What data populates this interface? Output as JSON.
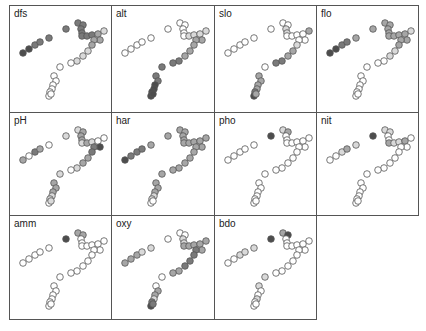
{
  "chart_data": {
    "type": "scatter",
    "title": "",
    "layout": {
      "columns": 4,
      "rows": 3,
      "panel_width": 103,
      "panel_height": 104
    },
    "shade_palette": [
      "#ffffff",
      "#d9d9d9",
      "#a6a6a6",
      "#7a7a7a",
      "#4d4d4d"
    ],
    "points": [
      {
        "x": 13,
        "y": 45
      },
      {
        "x": 19,
        "y": 41
      },
      {
        "x": 25,
        "y": 37
      },
      {
        "x": 30,
        "y": 34
      },
      {
        "x": 39,
        "y": 30
      },
      {
        "x": 56,
        "y": 21
      },
      {
        "x": 68,
        "y": 15
      },
      {
        "x": 73,
        "y": 17
      },
      {
        "x": 71,
        "y": 21
      },
      {
        "x": 72,
        "y": 25
      },
      {
        "x": 72,
        "y": 28
      },
      {
        "x": 77,
        "y": 28
      },
      {
        "x": 82,
        "y": 27
      },
      {
        "x": 88,
        "y": 26
      },
      {
        "x": 94,
        "y": 23
      },
      {
        "x": 90,
        "y": 32
      },
      {
        "x": 84,
        "y": 32
      },
      {
        "x": 82,
        "y": 37
      },
      {
        "x": 78,
        "y": 43
      },
      {
        "x": 73,
        "y": 48
      },
      {
        "x": 67,
        "y": 53
      },
      {
        "x": 61,
        "y": 55
      },
      {
        "x": 50,
        "y": 59
      },
      {
        "x": 44,
        "y": 68
      },
      {
        "x": 46,
        "y": 73
      },
      {
        "x": 43,
        "y": 77
      },
      {
        "x": 42,
        "y": 81
      },
      {
        "x": 40,
        "y": 84
      },
      {
        "x": 39,
        "y": 88
      },
      {
        "x": 41,
        "y": 86
      }
    ],
    "panels": [
      {
        "label": "dfs",
        "shades": [
          4,
          4,
          3,
          3,
          3,
          3,
          3,
          3,
          3,
          3,
          3,
          3,
          3,
          2,
          1,
          2,
          2,
          2,
          1,
          1,
          1,
          0,
          0,
          0,
          0,
          0,
          0,
          0,
          0,
          0
        ]
      },
      {
        "label": "alt",
        "shades": [
          0,
          0,
          0,
          0,
          0,
          0,
          0,
          0,
          0,
          0,
          0,
          1,
          1,
          1,
          1,
          2,
          2,
          2,
          2,
          2,
          3,
          3,
          3,
          3,
          3,
          4,
          4,
          4,
          4,
          4
        ]
      },
      {
        "label": "slo",
        "shades": [
          0,
          0,
          0,
          0,
          0,
          0,
          0,
          0,
          1,
          1,
          0,
          0,
          0,
          0,
          2,
          0,
          0,
          1,
          2,
          2,
          3,
          3,
          0,
          2,
          2,
          2,
          2,
          3,
          4,
          2
        ]
      },
      {
        "label": "flo",
        "shades": [
          4,
          4,
          3,
          3,
          2,
          2,
          2,
          2,
          2,
          2,
          2,
          2,
          2,
          2,
          1,
          2,
          2,
          2,
          1,
          1,
          0,
          0,
          0,
          0,
          0,
          0,
          0,
          0,
          0,
          0
        ]
      },
      {
        "label": "pH",
        "shades": [
          2,
          0,
          3,
          2,
          0,
          1,
          1,
          2,
          2,
          2,
          1,
          2,
          1,
          0,
          0,
          4,
          3,
          3,
          2,
          2,
          1,
          0,
          1,
          2,
          2,
          2,
          1,
          1,
          0,
          1
        ]
      },
      {
        "label": "har",
        "shades": [
          4,
          3,
          3,
          3,
          2,
          2,
          2,
          2,
          2,
          2,
          2,
          2,
          2,
          2,
          2,
          2,
          2,
          2,
          2,
          2,
          2,
          2,
          2,
          2,
          2,
          2,
          1,
          1,
          0,
          0
        ]
      },
      {
        "label": "pho",
        "shades": [
          0,
          0,
          0,
          0,
          0,
          4,
          1,
          2,
          0,
          0,
          0,
          0,
          0,
          0,
          0,
          0,
          0,
          0,
          0,
          0,
          0,
          0,
          0,
          0,
          0,
          0,
          0,
          0,
          0,
          0
        ]
      },
      {
        "label": "nit",
        "shades": [
          0,
          0,
          1,
          2,
          1,
          4,
          1,
          1,
          0,
          0,
          2,
          1,
          1,
          2,
          0,
          0,
          0,
          0,
          0,
          0,
          0,
          0,
          0,
          0,
          0,
          0,
          0,
          0,
          0,
          0
        ]
      },
      {
        "label": "amm",
        "shades": [
          0,
          0,
          0,
          0,
          0,
          4,
          2,
          2,
          0,
          0,
          0,
          0,
          0,
          0,
          0,
          0,
          0,
          0,
          0,
          0,
          0,
          0,
          0,
          0,
          0,
          0,
          0,
          0,
          0,
          0
        ]
      },
      {
        "label": "oxy",
        "shades": [
          2,
          2,
          2,
          1,
          1,
          0,
          0,
          0,
          1,
          1,
          2,
          2,
          2,
          2,
          2,
          2,
          3,
          3,
          3,
          3,
          2,
          2,
          0,
          0,
          2,
          2,
          1,
          3,
          4,
          3
        ]
      },
      {
        "label": "bdo",
        "shades": [
          0,
          0,
          1,
          1,
          1,
          4,
          2,
          4,
          0,
          0,
          0,
          0,
          0,
          0,
          0,
          0,
          0,
          0,
          0,
          0,
          0,
          0,
          1,
          1,
          0,
          0,
          1,
          0,
          0,
          0
        ]
      }
    ],
    "xlabel": "",
    "ylabel": "",
    "grid": false,
    "legend": null
  }
}
